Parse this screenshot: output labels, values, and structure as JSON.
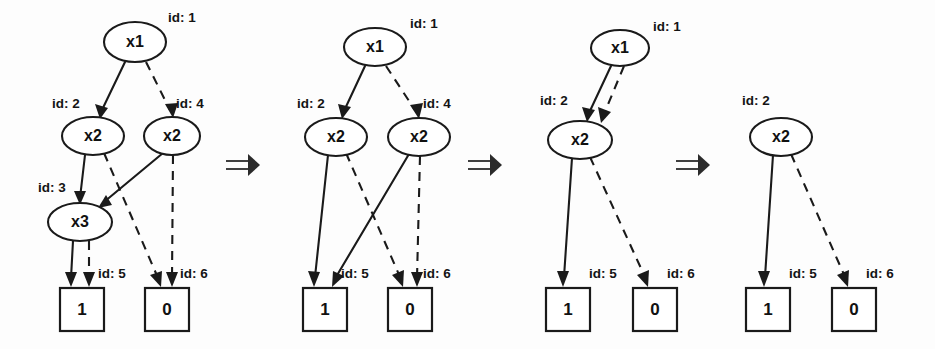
{
  "figure": {
    "background": "#fdfdfd",
    "ink": "#1a1a1a",
    "width": 935,
    "height": 349,
    "transform_symbol": "⟹"
  },
  "labels": {
    "x1": "x1",
    "x2": "x2",
    "x3": "x3",
    "one": "1",
    "zero": "0",
    "id1": "id: 1",
    "id2": "id: 2",
    "id3": "id: 3",
    "id4": "id: 4",
    "id5": "id: 5",
    "id6": "id: 6"
  },
  "panels": [
    {
      "name": "panel-1",
      "nodes": [
        {
          "id": 1,
          "label": "x1",
          "id_label": "id: 1",
          "shape": "ellipse",
          "cx": 135,
          "cy": 42,
          "rx": 31,
          "ry": 20,
          "id_x": 168,
          "id_y": 18
        },
        {
          "id": 2,
          "label": "x2",
          "id_label": "id: 2",
          "shape": "ellipse",
          "cx": 93,
          "cy": 136,
          "rx": 31,
          "ry": 19,
          "id_x": 52,
          "id_y": 104
        },
        {
          "id": 4,
          "label": "x2",
          "id_label": "id: 4",
          "shape": "ellipse",
          "cx": 172,
          "cy": 136,
          "rx": 28,
          "ry": 19,
          "id_x": 176,
          "id_y": 104
        },
        {
          "id": 3,
          "label": "x3",
          "id_label": "id: 3",
          "shape": "ellipse",
          "cx": 80,
          "cy": 222,
          "rx": 32,
          "ry": 19,
          "id_x": 38,
          "id_y": 188
        },
        {
          "id": 5,
          "label": "1",
          "id_label": "id: 5",
          "shape": "rect",
          "x": 60,
          "y": 288,
          "w": 44,
          "h": 43,
          "id_x": 98,
          "id_y": 274
        },
        {
          "id": 6,
          "label": "0",
          "id_label": "id: 6",
          "shape": "rect",
          "x": 145,
          "y": 288,
          "w": 44,
          "h": 43,
          "id_x": 180,
          "id_y": 274
        }
      ],
      "edges": [
        {
          "from": 1,
          "to": 2,
          "style": "solid"
        },
        {
          "from": 1,
          "to": 4,
          "style": "dashed"
        },
        {
          "from": 2,
          "to": 3,
          "style": "solid"
        },
        {
          "from": 2,
          "to": 6,
          "style": "dashed"
        },
        {
          "from": 4,
          "to": 3,
          "style": "solid"
        },
        {
          "from": 4,
          "to": 6,
          "style": "dashed"
        },
        {
          "from": 3,
          "to": 5,
          "style": "solid"
        },
        {
          "from": 3,
          "to": 5,
          "style": "dashed"
        }
      ]
    },
    {
      "name": "panel-2",
      "nodes": [
        {
          "id": 1,
          "label": "x1",
          "id_label": "id: 1",
          "shape": "ellipse",
          "cx": 375,
          "cy": 47,
          "rx": 31,
          "ry": 19,
          "id_x": 410,
          "id_y": 24
        },
        {
          "id": 2,
          "label": "x2",
          "id_label": "id: 2",
          "shape": "ellipse",
          "cx": 336,
          "cy": 137,
          "rx": 31,
          "ry": 19,
          "id_x": 297,
          "id_y": 104
        },
        {
          "id": 4,
          "label": "x2",
          "id_label": "id: 4",
          "shape": "ellipse",
          "cx": 419,
          "cy": 137,
          "rx": 31,
          "ry": 19,
          "id_x": 423,
          "id_y": 104
        },
        {
          "id": 5,
          "label": "1",
          "id_label": "id: 5",
          "shape": "rect",
          "x": 303,
          "y": 288,
          "w": 44,
          "h": 43,
          "id_x": 341,
          "id_y": 274
        },
        {
          "id": 6,
          "label": "0",
          "id_label": "id: 6",
          "shape": "rect",
          "x": 388,
          "y": 288,
          "w": 44,
          "h": 43,
          "id_x": 423,
          "id_y": 274
        }
      ],
      "edges": [
        {
          "from": 1,
          "to": 2,
          "style": "solid"
        },
        {
          "from": 1,
          "to": 4,
          "style": "dashed"
        },
        {
          "from": 2,
          "to": 5,
          "style": "solid"
        },
        {
          "from": 2,
          "to": 6,
          "style": "dashed"
        },
        {
          "from": 4,
          "to": 5,
          "style": "solid"
        },
        {
          "from": 4,
          "to": 6,
          "style": "dashed"
        }
      ]
    },
    {
      "name": "panel-3",
      "nodes": [
        {
          "id": 1,
          "label": "x1",
          "id_label": "id: 1",
          "shape": "ellipse",
          "cx": 620,
          "cy": 48,
          "rx": 29,
          "ry": 18,
          "id_x": 653,
          "id_y": 27
        },
        {
          "id": 2,
          "label": "x2",
          "id_label": "id: 2",
          "shape": "ellipse",
          "cx": 580,
          "cy": 140,
          "rx": 32,
          "ry": 19,
          "id_x": 540,
          "id_y": 101
        },
        {
          "id": 5,
          "label": "1",
          "id_label": "id: 5",
          "shape": "rect",
          "x": 546,
          "y": 288,
          "w": 44,
          "h": 43,
          "id_x": 589,
          "id_y": 274
        },
        {
          "id": 6,
          "label": "0",
          "id_label": "id: 6",
          "shape": "rect",
          "x": 633,
          "y": 288,
          "w": 44,
          "h": 43,
          "id_x": 667,
          "id_y": 274
        }
      ],
      "edges": [
        {
          "from": 1,
          "to": 2,
          "style": "solid"
        },
        {
          "from": 1,
          "to": 2,
          "style": "dashed"
        },
        {
          "from": 2,
          "to": 5,
          "style": "solid"
        },
        {
          "from": 2,
          "to": 6,
          "style": "dashed"
        }
      ]
    },
    {
      "name": "panel-4",
      "nodes": [
        {
          "id": 2,
          "label": "x2",
          "id_label": "id: 2",
          "shape": "ellipse",
          "cx": 781,
          "cy": 137,
          "rx": 31,
          "ry": 19,
          "id_x": 742,
          "id_y": 101
        },
        {
          "id": 5,
          "label": "1",
          "id_label": "id: 5",
          "shape": "rect",
          "x": 746,
          "y": 288,
          "w": 44,
          "h": 43,
          "id_x": 789,
          "id_y": 274
        },
        {
          "id": 6,
          "label": "0",
          "id_label": "id: 6",
          "shape": "rect",
          "x": 832,
          "y": 288,
          "w": 44,
          "h": 43,
          "id_x": 866,
          "id_y": 274
        }
      ],
      "edges": [
        {
          "from": 2,
          "to": 5,
          "style": "solid"
        },
        {
          "from": 2,
          "to": 6,
          "style": "dashed"
        }
      ]
    }
  ],
  "transform_arrows": [
    {
      "name": "transform-arrow-1",
      "x": 226,
      "y": 165
    },
    {
      "name": "transform-arrow-2",
      "x": 468,
      "y": 165
    },
    {
      "name": "transform-arrow-3",
      "x": 676,
      "y": 165
    }
  ]
}
